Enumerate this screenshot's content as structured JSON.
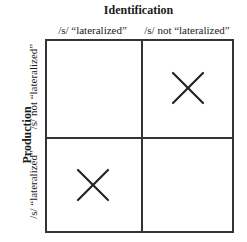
{
  "diagram": {
    "top_title": "Identification",
    "left_title": "Production",
    "columns": [
      "/s/ “lateralized”",
      "/s/ not “lateralized”"
    ],
    "rows": [
      "/s/ not “lateralized”",
      "/s/ “lateralized”"
    ],
    "cells": [
      [
        {
          "marked": false
        },
        {
          "marked": true,
          "symbol": "X"
        }
      ],
      [
        {
          "marked": true,
          "symbol": "X"
        },
        {
          "marked": false
        }
      ]
    ],
    "line_color": "#333333"
  }
}
